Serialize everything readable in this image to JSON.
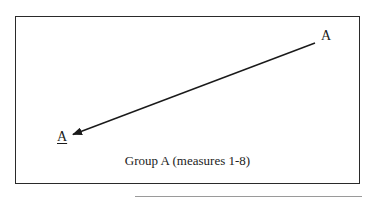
{
  "diagram": {
    "start_label": "A",
    "end_label": "A",
    "end_label_underlined": true,
    "caption": "Group A (measures 1-8)",
    "arrow": {
      "from": [
        315,
        43
      ],
      "to": [
        72,
        135
      ],
      "direction": "from top-right A to bottom-left underlined A"
    },
    "colors": {
      "stroke": "#1a1a1a",
      "border": "#2a2a2a",
      "background": "#ffffff"
    }
  }
}
